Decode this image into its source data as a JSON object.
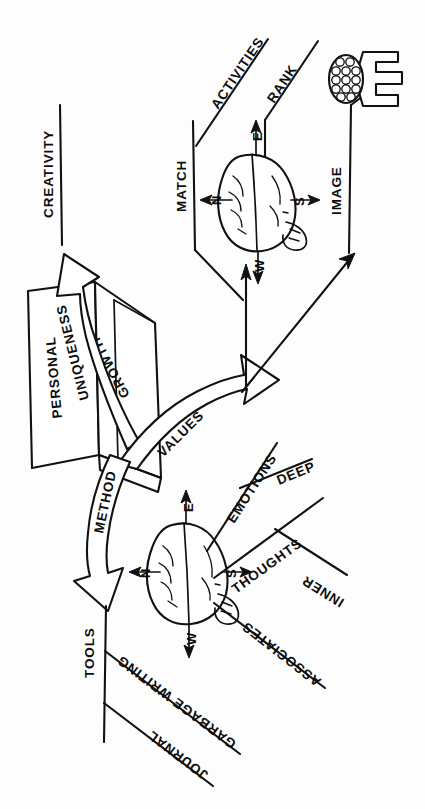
{
  "meta": {
    "background_color": "#fdfdfd",
    "ink_color": "#111111"
  },
  "center": {
    "box_face_left_label": "PERSONAL",
    "box_face_right_label": "GROWTH"
  },
  "arrows": {
    "uniqueness": "UNIQUENESS",
    "creativity": "CREATIVITY",
    "values": "VALUES",
    "method": "METHOD"
  },
  "branches": {
    "upper": [
      {
        "name": "activities",
        "label": "ACTIVITIES"
      },
      {
        "name": "rank",
        "label": "RANK"
      },
      {
        "name": "match",
        "label": "MATCH"
      },
      {
        "name": "image",
        "label": "IMAGE"
      }
    ],
    "lower": [
      {
        "name": "emotions",
        "label": "EMOTIONS"
      },
      {
        "name": "deep",
        "label": "DEEP"
      },
      {
        "name": "thoughts",
        "label": "THOUGHTS"
      },
      {
        "name": "inner",
        "label": "INNER"
      },
      {
        "name": "associates",
        "label": "ASSOCIATES"
      },
      {
        "name": "tools",
        "label": "TOOLS"
      },
      {
        "name": "garbage_writing",
        "label": "GARBAGE WRITING"
      },
      {
        "name": "journal",
        "label": "JOURNAL"
      }
    ]
  },
  "brains": {
    "upper": {
      "name": "brain-values",
      "compass": {
        "n": "N",
        "s": "S",
        "e": "E",
        "w": "W"
      }
    },
    "lower": {
      "name": "brain-method",
      "compass": {
        "n": "N",
        "s": "S",
        "e": "E",
        "w": "W"
      }
    }
  },
  "icons": {
    "bramble": "bramble-bracket-icon"
  }
}
